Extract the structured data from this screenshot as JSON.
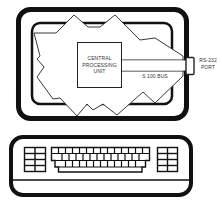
{
  "diagram": {
    "type": "illustration",
    "colors": {
      "line": "#111111",
      "background": "#ffffff",
      "text": "#333333"
    },
    "monitor": {
      "components": {
        "cpu": {
          "line1": "CENTRAL",
          "line2": "PROCESSING",
          "line3": "UNIT"
        },
        "bus": {
          "label": "S 100 BUS"
        },
        "port": {
          "line1": "RS-232",
          "line2": "PORT"
        }
      }
    },
    "keyboard": {
      "left_keypad": {
        "columns": 2,
        "rows": 4
      },
      "main_keys": {
        "columns": 14,
        "rows": 3
      },
      "right_keypad": {
        "columns": 2,
        "rows": 4
      }
    }
  }
}
